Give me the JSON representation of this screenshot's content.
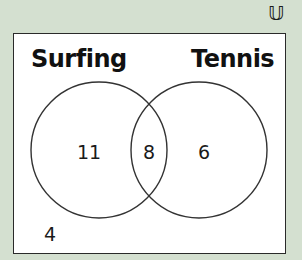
{
  "diagram": {
    "type": "venn",
    "universal_set_symbol": "𝕌",
    "sets": [
      {
        "name": "Surfing",
        "only_count": "11"
      },
      {
        "name": "Tennis",
        "only_count": "6"
      }
    ],
    "intersection_count": "8",
    "outside_count": "4",
    "colors": {
      "background": "#d4e0d0",
      "box_fill": "#ffffff",
      "stroke": "#2a2a2a",
      "text": "#111111"
    }
  }
}
